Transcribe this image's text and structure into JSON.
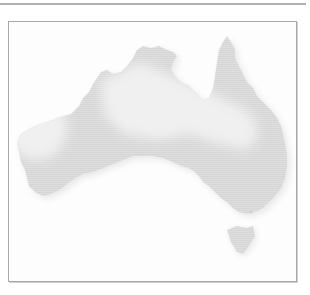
{
  "figure": {
    "colors": {
      "background": "#fdfdfd",
      "land": "#dcdcdc",
      "highlight_region": "#eeeeee",
      "frame": "#a8a8a8",
      "rule": "#b0b0b0"
    },
    "regions": [
      {
        "name": "mainland"
      },
      {
        "name": "tasmania"
      },
      {
        "name": "pale-region-west"
      },
      {
        "name": "pale-region-north-central"
      }
    ]
  }
}
